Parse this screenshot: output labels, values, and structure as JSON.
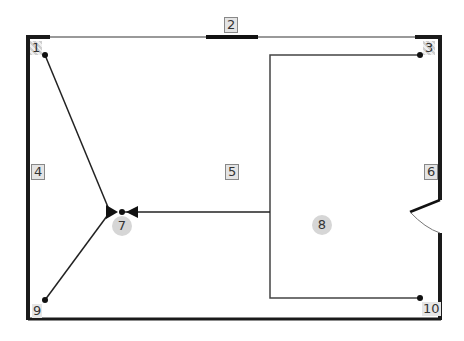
{
  "diagram": {
    "type": "floor-plan-network",
    "labels": {
      "n1": "1",
      "n2": "2",
      "n3": "3",
      "n4": "4",
      "n5": "5",
      "n6": "6",
      "n7": "7",
      "n8": "8",
      "n9": "9",
      "n10": "10"
    },
    "colors": {
      "wall": "#1a1a1a",
      "thin_wall": "#555555",
      "line": "#222222",
      "label_fill": "#e4e4e4",
      "circle_fill": "#d6d6d6"
    }
  }
}
